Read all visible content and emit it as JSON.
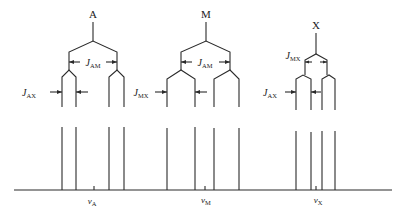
{
  "diagram": {
    "type": "NMR AMX splitting pattern",
    "multiplets": [
      {
        "nucleus": "A",
        "label": "A",
        "chemical_shift_label": "ν",
        "chemical_shift_sub": "A",
        "coupling_outer": {
          "J": "J",
          "sub": "AM"
        },
        "coupling_inner": {
          "J": "J",
          "sub": "AX"
        }
      },
      {
        "nucleus": "M",
        "label": "M",
        "chemical_shift_label": "ν",
        "chemical_shift_sub": "M",
        "coupling_outer": {
          "J": "J",
          "sub": "AM"
        },
        "coupling_inner": {
          "J": "J",
          "sub": "MX"
        }
      },
      {
        "nucleus": "X",
        "label": "X",
        "chemical_shift_label": "ν",
        "chemical_shift_sub": "X",
        "coupling_outer": {
          "J": "J",
          "sub": "MX"
        },
        "coupling_inner": {
          "J": "J",
          "sub": "AX"
        }
      }
    ],
    "line_color": "#2a2a2a"
  }
}
